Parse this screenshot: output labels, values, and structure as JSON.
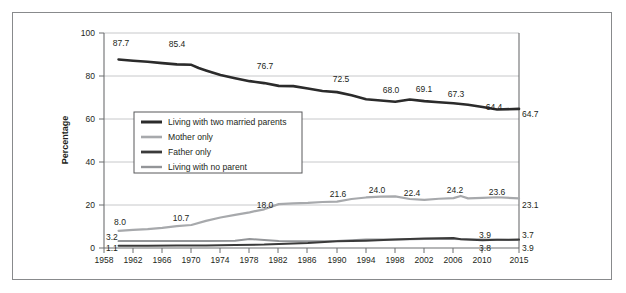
{
  "figure": {
    "frame_border_color": "#888a8c",
    "background": "#ffffff"
  },
  "chart_data": {
    "type": "line",
    "title": "",
    "xlabel": "",
    "ylabel": "Percentage",
    "xlim": [
      1958,
      2015
    ],
    "ylim": [
      0,
      100
    ],
    "yticks": [
      "0",
      "20",
      "40",
      "60",
      "80",
      "100"
    ],
    "xticks": [
      "1958",
      "1962",
      "1966",
      "1970",
      "1974",
      "1978",
      "1982",
      "1986",
      "1990",
      "1994",
      "1998",
      "2002",
      "2006",
      "2010",
      "2015"
    ],
    "grid": "horizontal",
    "legend_position": "inside-left-middle",
    "series": [
      {
        "name": "Living with two married parents",
        "color": "#2b2b2b",
        "x": [
          1960,
          1962,
          1964,
          1966,
          1968,
          1970,
          1971,
          1972,
          1974,
          1976,
          1978,
          1980,
          1982,
          1984,
          1986,
          1988,
          1990,
          1992,
          1994,
          1996,
          1998,
          2000,
          2002,
          2004,
          2006,
          2008,
          2010,
          2012,
          2015
        ],
        "values": [
          87.7,
          87.1,
          86.6,
          86.0,
          85.4,
          85.2,
          83.7,
          82.6,
          80.5,
          79.0,
          77.6,
          76.7,
          75.4,
          75.3,
          74.2,
          73.0,
          72.5,
          71.0,
          69.2,
          68.6,
          68.0,
          69.1,
          68.3,
          67.8,
          67.3,
          66.6,
          65.6,
          64.4,
          64.7
        ]
      },
      {
        "name": "Mother only",
        "color": "#a7a9ac",
        "x": [
          1960,
          1962,
          1964,
          1966,
          1968,
          1970,
          1972,
          1974,
          1976,
          1978,
          1980,
          1982,
          1984,
          1986,
          1988,
          1990,
          1992,
          1994,
          1996,
          1998,
          2000,
          2002,
          2004,
          2006,
          2007,
          2008,
          2010,
          2012,
          2015
        ],
        "values": [
          8.0,
          8.4,
          8.8,
          9.4,
          10.2,
          10.7,
          12.6,
          14.2,
          15.4,
          16.6,
          18.0,
          20.4,
          20.8,
          21.0,
          21.4,
          21.6,
          22.8,
          23.5,
          23.9,
          24.0,
          22.8,
          22.4,
          22.9,
          23.2,
          24.2,
          23.1,
          23.3,
          23.6,
          23.1
        ]
      },
      {
        "name": "Father only",
        "color": "#3a3a3a",
        "x": [
          1960,
          1964,
          1968,
          1972,
          1976,
          1980,
          1982,
          1986,
          1990,
          1994,
          1998,
          2002,
          2006,
          2007,
          2010,
          2012,
          2015
        ],
        "values": [
          1.1,
          1.1,
          1.2,
          1.2,
          1.4,
          1.6,
          1.9,
          2.3,
          3.1,
          3.4,
          4.0,
          4.4,
          4.6,
          4.1,
          3.6,
          3.8,
          3.9
        ]
      },
      {
        "name": "Living with no parent",
        "color": "#939598",
        "x": [
          1960,
          1964,
          1968,
          1972,
          1976,
          1978,
          1980,
          1982,
          1986,
          1990,
          1994,
          1998,
          2002,
          2006,
          2010,
          2012,
          2015
        ],
        "values": [
          3.2,
          3.3,
          3.3,
          3.3,
          3.4,
          4.2,
          3.7,
          3.3,
          3.1,
          3.2,
          3.9,
          4.0,
          4.2,
          4.2,
          4.0,
          3.8,
          3.7
        ]
      }
    ],
    "annotations": [
      {
        "text": "87.7",
        "series": "Living with two married parents",
        "x": 1960,
        "y": 87.7,
        "place": "above"
      },
      {
        "text": "85.4",
        "series": "Living with two married parents",
        "x": 1968,
        "y": 85.4,
        "place": "above"
      },
      {
        "text": "76.7",
        "series": "Living with two married parents",
        "x": 1980,
        "y": 76.7,
        "place": "above"
      },
      {
        "text": "72.5",
        "series": "Living with two married parents",
        "x": 1990,
        "y": 72.5,
        "place": "above"
      },
      {
        "text": "68.0",
        "series": "Living with two married parents",
        "x": 1998,
        "y": 68.0,
        "place": "above"
      },
      {
        "text": "69.1",
        "series": "Living with two married parents",
        "x": 2000,
        "y": 69.1,
        "place": "above"
      },
      {
        "text": "67.3",
        "series": "Living with two married parents",
        "x": 2006,
        "y": 67.3,
        "place": "above"
      },
      {
        "text": "64.4",
        "series": "Living with two married parents",
        "x": 2012,
        "y": 64.4,
        "place": "above"
      },
      {
        "text": "64.7",
        "series": "Living with two married parents",
        "x": 2015,
        "y": 64.7,
        "place": "right-outside"
      },
      {
        "text": "8.0",
        "series": "Mother only",
        "x": 1960,
        "y": 8.0,
        "place": "above"
      },
      {
        "text": "10.7",
        "series": "Mother only",
        "x": 1970,
        "y": 10.7,
        "place": "above"
      },
      {
        "text": "18.0",
        "series": "Mother only",
        "x": 1980,
        "y": 18.0,
        "place": "above"
      },
      {
        "text": "21.6",
        "series": "Mother only",
        "x": 1990,
        "y": 21.6,
        "place": "above"
      },
      {
        "text": "24.0",
        "series": "Mother only",
        "x": 1998,
        "y": 24.0,
        "place": "above"
      },
      {
        "text": "22.4",
        "series": "Mother only",
        "x": 2002,
        "y": 22.4,
        "place": "above"
      },
      {
        "text": "24.2",
        "series": "Mother only",
        "x": 2007,
        "y": 24.2,
        "place": "above"
      },
      {
        "text": "23.6",
        "series": "Mother only",
        "x": 2012,
        "y": 23.6,
        "place": "above"
      },
      {
        "text": "23.1",
        "series": "Mother only",
        "x": 2015,
        "y": 23.1,
        "place": "right-outside"
      },
      {
        "text": "3.2",
        "series": "Living with no parent",
        "x": 1960,
        "y": 3.2,
        "place": "above"
      },
      {
        "text": "3.9",
        "series": "Living with no parent",
        "x": 2011,
        "y": 3.9,
        "place": "above"
      },
      {
        "text": "3.7",
        "series": "Living with no parent",
        "x": 2015,
        "y": 3.7,
        "place": "right-outside"
      },
      {
        "text": "1.1",
        "series": "Father only",
        "x": 1960,
        "y": 1.1,
        "place": "above"
      },
      {
        "text": "3.8",
        "series": "Father only",
        "x": 2012,
        "y": 3.8,
        "place": "below"
      },
      {
        "text": "3.9",
        "series": "Father only",
        "x": 2015,
        "y": 3.9,
        "place": "right-outside"
      }
    ]
  },
  "legend": {
    "items": [
      {
        "label": "Living with two married parents",
        "color": "#2b2b2b"
      },
      {
        "label": "Mother only",
        "color": "#a7a9ac"
      },
      {
        "label": "Father only",
        "color": "#3a3a3a"
      },
      {
        "label": "Living with no parent",
        "color": "#939598"
      }
    ]
  }
}
